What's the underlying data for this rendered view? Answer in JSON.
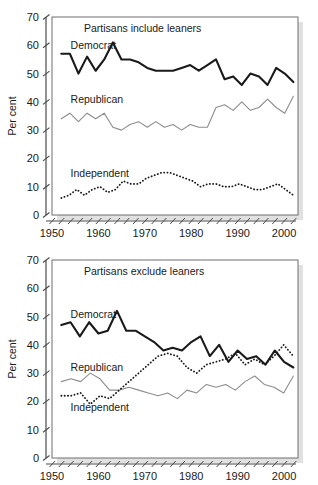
{
  "figure": {
    "ylabel": "Per cent",
    "y_ticks": [
      0,
      10,
      20,
      30,
      40,
      50,
      60,
      70
    ],
    "x_ticks": [
      1950,
      1960,
      1970,
      1980,
      1990,
      2000
    ],
    "x_minor_step": 2,
    "colors": {
      "democrat": "#1a1a1a",
      "republican": "#8c8c8c",
      "independent": "#1a1a1a",
      "axis": "#4a4a4a",
      "frame": "#6e6e6e",
      "shadow": "#c9c9c9",
      "background": "#ffffff"
    }
  },
  "chart_data": [
    {
      "type": "line",
      "title": "Partisans include leaners",
      "xlabel": "",
      "ylabel": "Per cent",
      "xlim": [
        1950,
        2003
      ],
      "ylim": [
        0,
        70
      ],
      "grid": false,
      "legend": "inline-labels",
      "x": [
        1952,
        1954,
        1956,
        1958,
        1960,
        1962,
        1964,
        1966,
        1968,
        1970,
        1972,
        1974,
        1976,
        1978,
        1980,
        1982,
        1984,
        1986,
        1988,
        1990,
        1992,
        1994,
        1996,
        1998,
        2000,
        2002
      ],
      "series": [
        {
          "name": "Democrat",
          "style": "solid",
          "width": 2.1,
          "color": "#1a1a1a",
          "label_x": 1954,
          "label_y": 60,
          "values": [
            57,
            57,
            50,
            56,
            51,
            55,
            61,
            55,
            55,
            54,
            52,
            51,
            51,
            51,
            52,
            53,
            51,
            53,
            55,
            48,
            49,
            46,
            50,
            49,
            46,
            52,
            50,
            47
          ]
        },
        {
          "name": "Republican",
          "style": "solid",
          "width": 1.1,
          "color": "#8c8c8c",
          "label_x": 1954,
          "label_y": 41,
          "values": [
            34,
            36,
            33,
            36,
            34,
            36,
            31,
            30,
            32,
            33,
            31,
            33,
            31,
            32,
            30,
            32,
            31,
            31,
            38,
            39,
            37,
            40,
            37,
            38,
            41,
            38,
            36,
            42
          ]
        },
        {
          "name": "Independent",
          "style": "dotted",
          "width": 1.8,
          "color": "#1a1a1a",
          "label_x": 1954,
          "label_y": 15,
          "values": [
            6,
            7,
            9,
            7,
            9,
            10,
            8,
            9,
            12,
            11,
            11,
            13,
            14,
            15,
            15,
            14,
            13,
            12,
            10,
            11,
            11,
            10,
            10,
            11,
            10,
            9,
            9,
            10,
            11,
            9,
            7
          ]
        }
      ]
    },
    {
      "type": "line",
      "title": "Partisans exclude leaners",
      "xlabel": "",
      "ylabel": "Per cent",
      "xlim": [
        1950,
        2003
      ],
      "ylim": [
        0,
        70
      ],
      "grid": false,
      "legend": "inline-labels",
      "x": [
        1952,
        1954,
        1956,
        1958,
        1960,
        1962,
        1964,
        1966,
        1968,
        1970,
        1972,
        1974,
        1976,
        1978,
        1980,
        1982,
        1984,
        1986,
        1988,
        1990,
        1992,
        1994,
        1996,
        1998,
        2000,
        2002
      ],
      "series": [
        {
          "name": "Democrat",
          "style": "solid",
          "width": 2.1,
          "color": "#1a1a1a",
          "label_x": 1954,
          "label_y": 51,
          "values": [
            47,
            48,
            43,
            48,
            44,
            45,
            52,
            45,
            45,
            43,
            41,
            38,
            39,
            38,
            41,
            43,
            36,
            40,
            34,
            38,
            35,
            36,
            33,
            38,
            34,
            32
          ]
        },
        {
          "name": "Republican",
          "style": "solid",
          "width": 1.1,
          "color": "#8c8c8c",
          "label_x": 1954,
          "label_y": 32,
          "values": [
            27,
            28,
            27,
            30,
            28,
            24,
            24,
            25,
            24,
            23,
            22,
            23,
            21,
            24,
            23,
            26,
            25,
            26,
            24,
            27,
            29,
            26,
            25,
            23,
            29
          ]
        },
        {
          "name": "Independent",
          "style": "dotted",
          "width": 1.8,
          "color": "#1a1a1a",
          "label_x": 1954,
          "label_y": 18,
          "values": [
            22,
            22,
            23,
            19,
            22,
            21,
            24,
            27,
            30,
            33,
            36,
            37,
            36,
            32,
            30,
            33,
            34,
            35,
            37,
            33,
            35,
            33,
            36,
            40,
            36
          ]
        }
      ]
    }
  ]
}
